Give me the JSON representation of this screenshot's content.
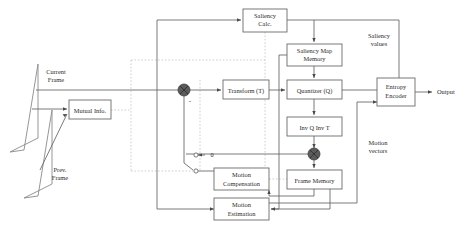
{
  "diagram": {
    "blocks": [
      {
        "id": "saliency_calc",
        "label_line1": "Saliency",
        "label_line2": "Calc.",
        "x": 243,
        "y": 9,
        "w": 44,
        "h": 23
      },
      {
        "id": "saliency_map_mem",
        "label_line1": "Saliency Map",
        "label_line2": "Memory",
        "x": 287,
        "y": 44,
        "w": 55,
        "h": 22
      },
      {
        "id": "transform",
        "label_line1": "Transform (T)",
        "label_line2": "",
        "x": 223,
        "y": 80,
        "w": 46,
        "h": 19
      },
      {
        "id": "quantizer",
        "label_line1": "Quantizer (Q)",
        "label_line2": "",
        "x": 287,
        "y": 80,
        "w": 55,
        "h": 19
      },
      {
        "id": "entropy_encoder",
        "label_line1": "Entropy",
        "label_line2": "Encoder",
        "x": 377,
        "y": 78,
        "w": 38,
        "h": 28
      },
      {
        "id": "inv_q_inv_t",
        "label_line1": "Inv Q Inv T",
        "label_line2": "",
        "x": 287,
        "y": 117,
        "w": 55,
        "h": 19
      },
      {
        "id": "frame_memory",
        "label_line1": "Frame Memory",
        "label_line2": "",
        "x": 287,
        "y": 170,
        "w": 55,
        "h": 19
      },
      {
        "id": "motion_comp",
        "label_line1": "Motion",
        "label_line2": "Compensation",
        "x": 214,
        "y": 168,
        "w": 55,
        "h": 22
      },
      {
        "id": "motion_est",
        "label_line1": "Motion",
        "label_line2": "Estimation",
        "x": 214,
        "y": 198,
        "w": 55,
        "h": 22
      },
      {
        "id": "mutual_info",
        "label_line1": "Mutual Info.",
        "label_line2": "",
        "x": 69,
        "y": 100,
        "w": 42,
        "h": 19
      }
    ],
    "frames": [
      {
        "id": "current_frame",
        "label_line1": "Current",
        "label_line2": "Frame"
      },
      {
        "id": "prev_frame",
        "label_line1": "Prev.",
        "label_line2": "Frame"
      }
    ],
    "annotations": [
      {
        "id": "saliency_values",
        "line1": "Saliency",
        "line2": "values",
        "x": 379,
        "y": 38
      },
      {
        "id": "motion_vectors",
        "line1": "Motion",
        "line2": "vectors",
        "x": 378,
        "y": 145
      },
      {
        "id": "output",
        "line1": "Output",
        "line2": "",
        "x": 443,
        "y": 92
      }
    ],
    "switch": {
      "id": "mode-switch",
      "zero_label": "0"
    },
    "signs": {
      "minus": "-"
    },
    "colors": {
      "line": "#6b6b6b",
      "dotted": "#c2c2c2",
      "node_fill": "#5b5b5b",
      "text": "#2b2b2b",
      "background": "#ffffff"
    }
  }
}
